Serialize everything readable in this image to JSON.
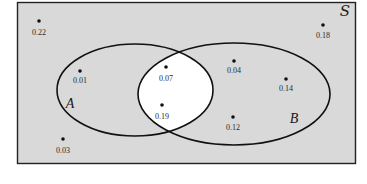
{
  "diagram": {
    "type": "venn",
    "sample_space_label": "S",
    "sets": [
      {
        "name": "A",
        "label": "A"
      },
      {
        "name": "B",
        "label": "B"
      }
    ],
    "colors": {
      "background": "#d9d9d9",
      "intersection": "#ffffff",
      "stroke": "#111111",
      "dot": "#111111"
    },
    "points": [
      {
        "region": "outside",
        "value": "0.22"
      },
      {
        "region": "A_only",
        "value": "0.01"
      },
      {
        "region": "A_and_B",
        "value": "0.07"
      },
      {
        "region": "A_and_B",
        "value": "0.19"
      },
      {
        "region": "B_only",
        "value": "0.04"
      },
      {
        "region": "B_only",
        "value": "0.14"
      },
      {
        "region": "B_only",
        "value": "0.12"
      },
      {
        "region": "outside",
        "value": "0.03"
      },
      {
        "region": "outside",
        "value": "0.18"
      }
    ]
  }
}
